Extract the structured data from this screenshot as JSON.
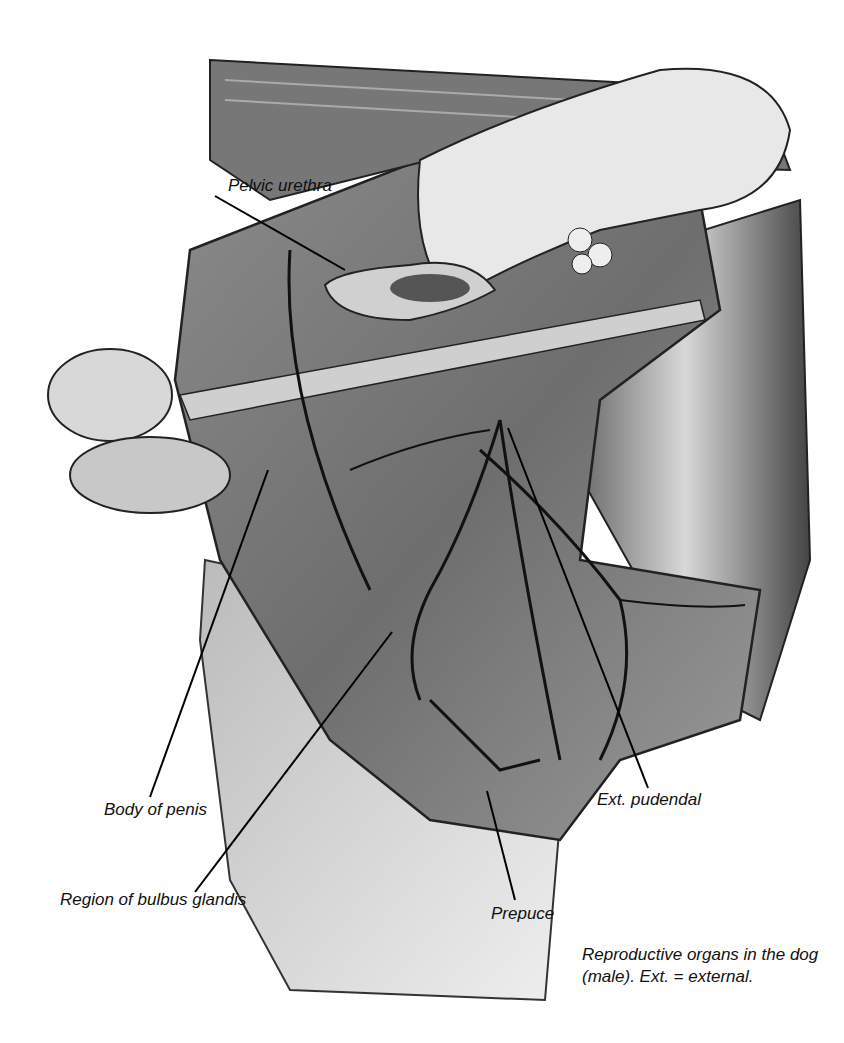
{
  "figure": {
    "type": "anatomical-illustration",
    "subject": "Reproductive organs in the dog (male)",
    "style": "grayscale pencil drawing",
    "labels": [
      {
        "id": "pelvic-urethra",
        "text": "Pelvic urethra",
        "x": 228,
        "y": 176,
        "line": [
          [
            215,
            196
          ],
          [
            345,
            270
          ]
        ]
      },
      {
        "id": "body-of-penis",
        "text": "Body of penis",
        "x": 104,
        "y": 797,
        "line": [
          [
            150,
            797
          ],
          [
            268,
            470
          ]
        ]
      },
      {
        "id": "region-of-bulbus-glandis",
        "text": "Region of bulbus glandis",
        "x": 60,
        "y": 890,
        "line": [
          [
            195,
            892
          ],
          [
            392,
            632
          ]
        ]
      },
      {
        "id": "prepuce",
        "text": "Prepuce",
        "x": 491,
        "y": 904,
        "line": [
          [
            515,
            900
          ],
          [
            487,
            791
          ]
        ]
      },
      {
        "id": "ext-pudendal",
        "text": "Ext. pudendal",
        "x": 597,
        "y": 790,
        "line": [
          [
            648,
            788
          ],
          [
            508,
            428
          ]
        ]
      }
    ],
    "caption": {
      "line1": "Reproductive organs in the dog",
      "line2": "(male). Ext. = external."
    }
  }
}
